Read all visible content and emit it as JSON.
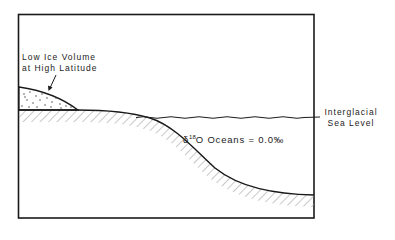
{
  "diagram": {
    "ice_label": [
      "Low Ice Volume",
      "at High Latitude"
    ],
    "sea_level_label": [
      "Interglacial",
      "Sea Level"
    ],
    "isotope_label": {
      "delta": "δ",
      "mass": "18",
      "element": "O Oceans = 0.0‰"
    },
    "colors": {
      "line": "#1a1a1a",
      "hatch": "#9a9a9a",
      "background": "#ffffff"
    }
  }
}
